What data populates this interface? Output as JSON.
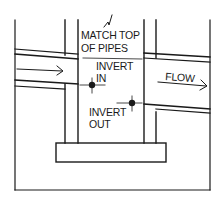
{
  "diagram": {
    "type": "manhole-section",
    "labels": {
      "match_top_line1": "MATCH TOP",
      "match_top_line2": "OF PIPES",
      "invert_in_line1": "INVERT",
      "invert_in_line2": "IN",
      "invert_out_line1": "INVERT",
      "invert_out_line2": "OUT",
      "flow": "FLOW"
    },
    "icons": {
      "inflow_arrow": "arrow-right",
      "outflow_arrow": "arrow-right",
      "break_mark": "zigzag-break",
      "invert_marker": "crosshair-dot"
    },
    "colors": {
      "line": "#1a1a1a",
      "background": "#ffffff"
    }
  }
}
